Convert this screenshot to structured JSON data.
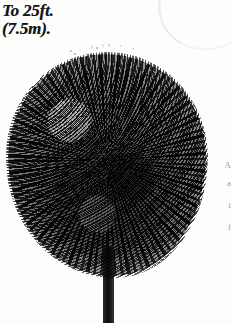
{
  "figure": {
    "illustration_style": "halftone-engraving",
    "caption_lines": [
      "To 25ft.",
      "(7.5m)."
    ],
    "height_imperial": "25ft.",
    "height_metric": "7.5m"
  },
  "tree": {
    "canopy_shape": "rounded-dense",
    "trunk_label": "trunk",
    "canopy_label": "canopy"
  },
  "artifacts": {
    "page_curl_label": "page-curl",
    "edge_fragments": [
      "A",
      "a",
      "t",
      "f"
    ]
  },
  "colors": {
    "background": "#fdfdfc",
    "ink": "#151515",
    "foliage_mid": "#6f6f6f",
    "foliage_light": "#e6e6e6",
    "trunk": "#0d0d0d"
  }
}
